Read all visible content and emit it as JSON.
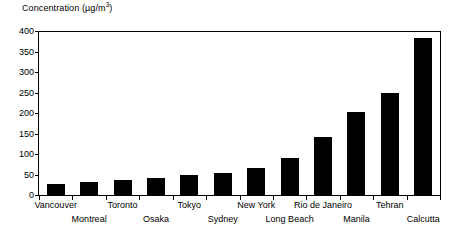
{
  "chart_data": {
    "type": "bar",
    "title": "",
    "xlabel": "",
    "ylabel": "Concentration (µg/m3)",
    "ylabel_prefix": "Concentration (µg/m",
    "ylabel_superscript": "3",
    "ylabel_suffix": ")",
    "ylim": [
      0,
      400
    ],
    "ytick_step": 50,
    "grid": false,
    "legend": "none",
    "bar_color": "#000000",
    "axis_color": "#000000",
    "background": "#ffffff",
    "categories": [
      "Vancouver",
      "Montreal",
      "Toronto",
      "Osaka",
      "Tokyo",
      "Sydney",
      "New York",
      "Long Beach",
      "Rio de Janeiro",
      "Manila",
      "Tehran",
      "Calcutta"
    ],
    "values": [
      30,
      35,
      38,
      45,
      52,
      57,
      68,
      92,
      145,
      205,
      252,
      385
    ],
    "yticks": [
      0,
      50,
      100,
      150,
      200,
      250,
      300,
      350,
      400
    ],
    "ytick_labels": [
      "0",
      "50",
      "100",
      "150",
      "200",
      "250",
      "300",
      "350",
      "400"
    ],
    "label_rows": [
      "top",
      "bottom",
      "top",
      "bottom",
      "top",
      "bottom",
      "top",
      "bottom",
      "top",
      "bottom",
      "top",
      "bottom"
    ]
  }
}
